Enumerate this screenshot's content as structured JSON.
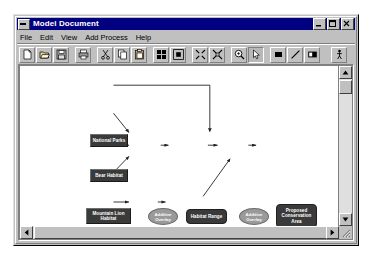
{
  "window": {
    "title": "Model Document",
    "sysmenu_icon": "system-menu-icon",
    "buttons": [
      {
        "name": "minimize",
        "icon": "minimize-icon"
      },
      {
        "name": "maximize",
        "icon": "maximize-icon"
      },
      {
        "name": "close",
        "icon": "close-icon"
      }
    ]
  },
  "menu": {
    "items": [
      {
        "label": "File"
      },
      {
        "label": "Edit"
      },
      {
        "label": "View"
      },
      {
        "label": "Add Process"
      },
      {
        "label": "Help"
      }
    ]
  },
  "toolbar": {
    "buttons": [
      {
        "name": "new-document-button",
        "icon": "new-page-icon",
        "state": "raised"
      },
      {
        "name": "open-document-button",
        "icon": "open-folder-icon",
        "state": "raised"
      },
      {
        "name": "save-document-button",
        "icon": "save-disk-icon",
        "state": "raised"
      },
      {
        "name": "print-button",
        "icon": "printer-icon",
        "state": "raised"
      },
      {
        "name": "cut-button",
        "icon": "scissors-icon",
        "state": "raised"
      },
      {
        "name": "copy-button",
        "icon": "copy-icon",
        "state": "raised"
      },
      {
        "name": "paste-button",
        "icon": "paste-clipboard-icon",
        "state": "raised"
      },
      {
        "name": "arrange-layout-button",
        "icon": "grid-blocks-icon",
        "state": "raised"
      },
      {
        "name": "fit-layout-button",
        "icon": "expand-frame-icon",
        "state": "raised"
      },
      {
        "name": "zoom-out-button",
        "icon": "zoom-out-arrows-icon",
        "state": "raised"
      },
      {
        "name": "zoom-fit-button",
        "icon": "zoom-fit-arrows-icon",
        "state": "raised"
      },
      {
        "name": "zoom-tool-button",
        "icon": "magnifier-icon",
        "state": "raised"
      },
      {
        "name": "select-pointer-button",
        "icon": "arrow-pointer-icon",
        "state": "pressed"
      },
      {
        "name": "add-data-element-button",
        "icon": "filled-rect-icon",
        "state": "raised"
      },
      {
        "name": "add-connector-button",
        "icon": "diagonal-line-icon",
        "state": "raised"
      },
      {
        "name": "add-process-element-button",
        "icon": "rect-with-label-icon",
        "state": "raised"
      },
      {
        "name": "run-model-button",
        "icon": "run-person-icon",
        "state": "raised"
      }
    ]
  },
  "diagram": {
    "nodes": [
      {
        "id": "national-parks",
        "label": "National Parks",
        "type": "data",
        "x": 70,
        "y": 68,
        "w": 38,
        "h": 13
      },
      {
        "id": "bear-habitat",
        "label": "Bear Habitat",
        "type": "data",
        "x": 70,
        "y": 103,
        "w": 38,
        "h": 13
      },
      {
        "id": "mountain-lion-habitat",
        "label": "Mountain Lion Habitat",
        "type": "data",
        "x": 66,
        "y": 142,
        "w": 45,
        "h": 16
      },
      {
        "id": "deer-habitat",
        "label": "Deer Habitat",
        "type": "data",
        "x": 70,
        "y": 178,
        "w": 38,
        "h": 13
      },
      {
        "id": "roads",
        "label": "Roads",
        "type": "data",
        "x": 70,
        "y": 214,
        "w": 38,
        "h": 13
      },
      {
        "id": "additive-overlay-1",
        "label": "Additive Overlay",
        "type": "process",
        "x": 128,
        "y": 142,
        "w": 30,
        "h": 17
      },
      {
        "id": "habitat-range",
        "label": "Habitat Range",
        "type": "derived",
        "x": 166,
        "y": 143,
        "w": 41,
        "h": 15
      },
      {
        "id": "additive-overlay-2",
        "label": "Additive Overlay",
        "type": "process",
        "x": 219,
        "y": 142,
        "w": 30,
        "h": 17
      },
      {
        "id": "proposed-conservation-area",
        "label": "Proposed Conservation Area",
        "type": "derived",
        "x": 256,
        "y": 138,
        "w": 41,
        "h": 24
      },
      {
        "id": "buffer",
        "label": "Buffer",
        "type": "process",
        "x": 128,
        "y": 214,
        "w": 28,
        "h": 14
      },
      {
        "id": "roads-buffer",
        "label": "Roads Buffer",
        "type": "derived",
        "x": 163,
        "y": 214,
        "w": 39,
        "h": 14
      }
    ],
    "edges": [
      {
        "from": "national-parks",
        "to": "additive-overlay-2"
      },
      {
        "from": "bear-habitat",
        "to": "additive-overlay-1"
      },
      {
        "from": "mountain-lion-habitat",
        "to": "additive-overlay-1"
      },
      {
        "from": "deer-habitat",
        "to": "additive-overlay-1"
      },
      {
        "from": "additive-overlay-1",
        "to": "habitat-range"
      },
      {
        "from": "habitat-range",
        "to": "additive-overlay-2"
      },
      {
        "from": "additive-overlay-2",
        "to": "proposed-conservation-area"
      },
      {
        "from": "roads",
        "to": "buffer"
      },
      {
        "from": "buffer",
        "to": "roads-buffer"
      },
      {
        "from": "roads-buffer",
        "to": "additive-overlay-2"
      }
    ]
  },
  "scrollbars": {
    "vertical": {
      "up_arrow": "scroll-up-arrow-icon",
      "down_arrow": "scroll-down-arrow-icon"
    },
    "horizontal": {
      "left_arrow": "scroll-left-arrow-icon",
      "right_arrow": "scroll-right-arrow-icon"
    },
    "resize_grip": "resize-grip-icon"
  }
}
